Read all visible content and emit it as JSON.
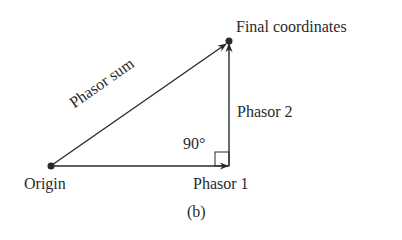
{
  "figure": {
    "caption": "(b)",
    "labels": {
      "final": "Final coordinates",
      "phasor_sum": "Phasor sum",
      "phasor_2": "Phasor 2",
      "angle": "90°",
      "origin": "Origin",
      "phasor_1": "Phasor 1"
    },
    "colors": {
      "line": "#2a2a2a",
      "background": "#ffffff"
    },
    "geometry": {
      "origin": [
        51,
        166
      ],
      "corner": [
        229,
        166
      ],
      "final": [
        229,
        41
      ],
      "right_angle_marker": true
    }
  }
}
